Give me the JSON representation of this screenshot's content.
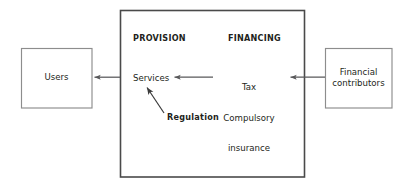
{
  "diagram": {
    "background_color": "#ffffff",
    "text_color": "#231f20",
    "outer_box_color": "#4a4a4a",
    "side_box_color": "#8a8a8a",
    "arrow_color": "#58585a"
  },
  "main_box": {
    "name": "health-system-box",
    "sections": [
      {
        "id": "provision",
        "label": "PROVISION",
        "emphasis": "bold"
      },
      {
        "id": "financing",
        "label": "FINANCING",
        "emphasis": "bold"
      }
    ],
    "items": [
      {
        "id": "services",
        "label": "Services",
        "emphasis": "regular"
      },
      {
        "id": "funding-sources",
        "lines": [
          "Tax",
          "Compulsory",
          "insurance"
        ],
        "emphasis": "regular"
      },
      {
        "id": "regulation",
        "label": "Regulation",
        "emphasis": "bold"
      }
    ]
  },
  "left_box": {
    "name": "users-box",
    "label": "Users"
  },
  "right_box": {
    "name": "financial-contributors-box",
    "lines": [
      "Financial",
      "contributors"
    ],
    "line1": "Financial",
    "line2": "contributors"
  },
  "arrows": [
    {
      "id": "services-to-users",
      "from": "Services",
      "to": "Users",
      "direction": "left"
    },
    {
      "id": "financing-to-services",
      "from": "Tax Compulsory insurance",
      "to": "Services",
      "direction": "left"
    },
    {
      "id": "contributors-to-financing",
      "from": "Financial contributors",
      "to": "Tax Compulsory insurance",
      "direction": "left"
    },
    {
      "id": "regulation-to-services",
      "from": "Regulation",
      "to": "Services",
      "direction": "up-left"
    }
  ]
}
